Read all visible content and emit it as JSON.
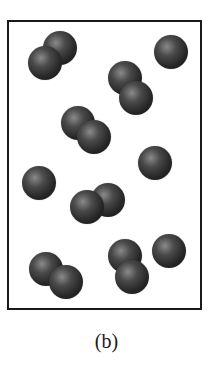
{
  "figure": {
    "label": "(b)",
    "particle_color": "#2a2a2a",
    "border_color": "#1a1a1a"
  },
  "particles": {
    "diatomic_molecules": 6,
    "single_atoms": 4,
    "balls": [
      {
        "x": 60,
        "y": 48,
        "r": 17
      },
      {
        "x": 45,
        "y": 63,
        "r": 17
      },
      {
        "x": 125,
        "y": 78,
        "r": 17
      },
      {
        "x": 136,
        "y": 98,
        "r": 17
      },
      {
        "x": 78,
        "y": 123,
        "r": 17
      },
      {
        "x": 94,
        "y": 137,
        "r": 17
      },
      {
        "x": 108,
        "y": 200,
        "r": 17
      },
      {
        "x": 87,
        "y": 207,
        "r": 17
      },
      {
        "x": 46,
        "y": 269,
        "r": 17
      },
      {
        "x": 66,
        "y": 282,
        "r": 17
      },
      {
        "x": 125,
        "y": 256,
        "r": 17
      },
      {
        "x": 132,
        "y": 277,
        "r": 17
      },
      {
        "x": 171,
        "y": 52,
        "r": 17
      },
      {
        "x": 155,
        "y": 163,
        "r": 17
      },
      {
        "x": 39,
        "y": 183,
        "r": 17
      },
      {
        "x": 169,
        "y": 251,
        "r": 17
      }
    ]
  }
}
